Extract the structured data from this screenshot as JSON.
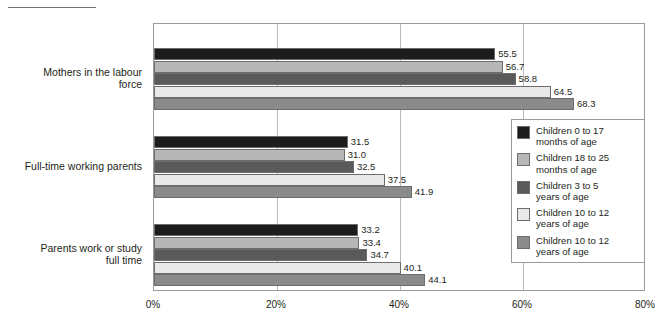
{
  "chart_data": {
    "type": "bar",
    "orientation": "horizontal",
    "title": "",
    "subtitle": "",
    "xlabel": "",
    "ylabel": "",
    "xlim": [
      0,
      80
    ],
    "xticks": [
      "0%",
      "20%",
      "40%",
      "60%",
      "80%"
    ],
    "xtick_values": [
      0,
      20,
      40,
      60,
      80
    ],
    "grid": true,
    "grid_axis": "x",
    "legend_position": "right",
    "categories": [
      "Mothers in the labour force",
      "Full-time working parents",
      "Parents work or study full time"
    ],
    "category_lines": [
      [
        "Mothers in the labour",
        "force"
      ],
      [
        "Full-time working parents"
      ],
      [
        "Parents work or study",
        "full time"
      ]
    ],
    "series": [
      {
        "name": "Children 0 to 17 months of age",
        "name_lines": [
          "Children 0 to 17",
          "months of age"
        ],
        "color": "#1c1c1c",
        "values": [
          55.5,
          31.5,
          33.2
        ],
        "labels": [
          "55.5",
          "31.5",
          "33.2"
        ]
      },
      {
        "name": "Children 18 to 25 months of age",
        "name_lines": [
          "Children 18 to 25",
          "months of age"
        ],
        "color": "#b7b7b7",
        "values": [
          56.7,
          31.0,
          33.4
        ],
        "labels": [
          "56.7",
          "31.0",
          "33.4"
        ]
      },
      {
        "name": "Children 3 to 5 years of age",
        "name_lines": [
          "Children 3 to 5",
          "years of age"
        ],
        "color": "#5a5a5a",
        "values": [
          58.8,
          32.5,
          34.7
        ],
        "labels": [
          "58.8",
          "32.5",
          "34.7"
        ]
      },
      {
        "name": "Children 10 to 12 years of age",
        "name_lines": [
          "Children 10 to 12",
          "years of age"
        ],
        "color": "#e9e9e9",
        "values": [
          64.5,
          37.5,
          40.1
        ],
        "labels": [
          "64.5",
          "37.5",
          "40.1"
        ]
      },
      {
        "name": "Children 10 to 12 years of age",
        "name_lines": [
          "Children 10 to 12",
          "years of age"
        ],
        "color": "#8b8b8b",
        "values": [
          68.3,
          41.9,
          44.1
        ],
        "labels": [
          "68.3",
          "41.9",
          "44.1"
        ]
      }
    ]
  }
}
